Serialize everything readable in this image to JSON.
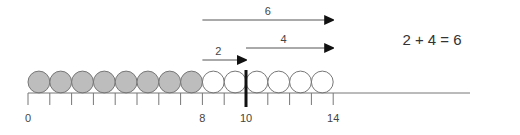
{
  "equation": "2 + 4 = 6",
  "number_line": {
    "start": 0,
    "end": 14,
    "tick_labels": [
      {
        "value": 0,
        "label": "0"
      },
      {
        "value": 8,
        "label": "8"
      },
      {
        "value": 10,
        "label": "10"
      },
      {
        "value": 14,
        "label": "14"
      }
    ],
    "highlight_value": 10
  },
  "counters": {
    "shaded_count": 8,
    "unshaded_count": 6,
    "shaded_color": "#bdbdbd",
    "unshaded_color": "#ffffff"
  },
  "arrows": [
    {
      "label": "6",
      "from": 8,
      "to": 14
    },
    {
      "label": "2",
      "from": 8,
      "to": 10
    },
    {
      "label": "4",
      "from": 10,
      "to": 14
    }
  ]
}
